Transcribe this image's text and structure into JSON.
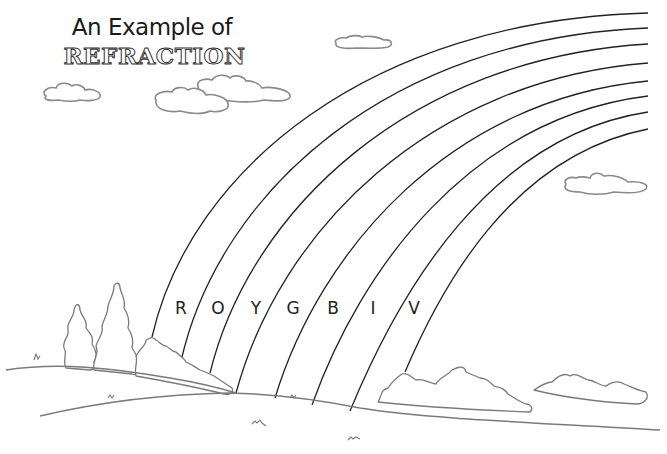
{
  "title": {
    "line1": "An Example of",
    "line2": "REFRACTION"
  },
  "rainbow": {
    "band_labels": [
      {
        "letter": "R",
        "color_name": "red",
        "x": 181,
        "y": 298
      },
      {
        "letter": "O",
        "color_name": "orange",
        "x": 218,
        "y": 298
      },
      {
        "letter": "Y",
        "color_name": "yellow",
        "x": 256,
        "y": 298
      },
      {
        "letter": "G",
        "color_name": "green",
        "x": 293,
        "y": 298
      },
      {
        "letter": "B",
        "color_name": "blue",
        "x": 333,
        "y": 298
      },
      {
        "letter": "I",
        "color_name": "indigo",
        "x": 373,
        "y": 298
      },
      {
        "letter": "V",
        "color_name": "violet",
        "x": 414,
        "y": 298
      }
    ],
    "arc_count": 8,
    "line_color": "#222222"
  },
  "scene": {
    "clouds": [
      "cloud-left",
      "cloud-center-front",
      "cloud-center-back",
      "cloud-small-top",
      "cloud-right"
    ],
    "outline_color": "#8a8a8a",
    "background": "#ffffff"
  }
}
